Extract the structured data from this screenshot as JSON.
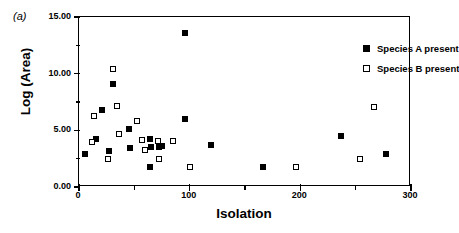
{
  "panel_label": "(a)",
  "chart_data": {
    "type": "scatter",
    "title": "",
    "xlabel": "Isolation",
    "ylabel": "Log (Area)",
    "xlim": [
      0,
      300
    ],
    "ylim": [
      0,
      15
    ],
    "grid": false,
    "legend_position": "top-right",
    "x_ticks_major": [
      0,
      100,
      200,
      300
    ],
    "x_tick_labels": [
      "0",
      "100",
      "200",
      "300"
    ],
    "x_ticks_minor": [
      50,
      150,
      250
    ],
    "y_ticks_major": [
      0,
      5,
      10,
      15
    ],
    "y_tick_labels": [
      "0.00",
      "5.00",
      "10.00",
      "15.00"
    ],
    "y_ticks_minor": [
      2.5,
      7.5,
      12.5
    ],
    "series": [
      {
        "name": "Species A present",
        "marker": "filled-square",
        "color": "#000000",
        "points": [
          [
            5,
            2.9
          ],
          [
            15,
            4.2
          ],
          [
            21,
            6.8
          ],
          [
            27,
            3.2
          ],
          [
            31,
            9.1
          ],
          [
            45,
            5.15
          ],
          [
            46,
            3.45
          ],
          [
            64,
            4.25
          ],
          [
            64,
            1.8
          ],
          [
            65,
            3.5
          ],
          [
            72,
            3.55
          ],
          [
            75,
            3.65
          ],
          [
            96,
            13.6
          ],
          [
            96,
            6.0
          ],
          [
            119,
            3.75
          ],
          [
            166,
            1.8
          ],
          [
            237,
            4.5
          ],
          [
            277,
            2.9
          ]
        ]
      },
      {
        "name": "Species B present",
        "marker": "open-square",
        "color": "#000000",
        "points": [
          [
            12,
            3.95
          ],
          [
            14,
            6.25
          ],
          [
            26,
            2.5
          ],
          [
            31,
            10.45
          ],
          [
            34,
            7.15
          ],
          [
            36,
            4.7
          ],
          [
            52,
            5.8
          ],
          [
            57,
            4.15
          ],
          [
            60,
            3.25
          ],
          [
            72,
            2.5
          ],
          [
            71,
            4.1
          ],
          [
            85,
            4.05
          ],
          [
            100,
            1.8
          ],
          [
            196,
            1.8
          ],
          [
            254,
            2.5
          ],
          [
            267,
            7.05
          ]
        ]
      }
    ]
  }
}
